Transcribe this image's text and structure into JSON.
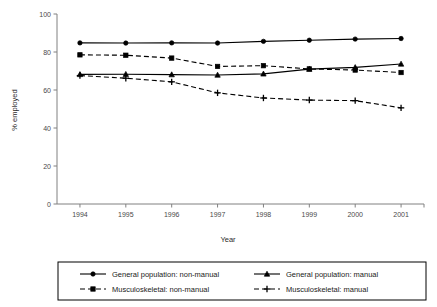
{
  "chart_data": {
    "type": "line",
    "title": "",
    "xlabel": "Year",
    "ylabel": "% employed",
    "categories": [
      "1994",
      "1995",
      "1996",
      "1997",
      "1998",
      "1999",
      "2000",
      "2001"
    ],
    "x": [
      1994,
      1995,
      1996,
      1997,
      1998,
      1999,
      2000,
      2001
    ],
    "ylim": [
      0,
      100
    ],
    "yticks": [
      0,
      20,
      40,
      60,
      80,
      100
    ],
    "ytick_labels": [
      "0",
      "20",
      "40",
      "60",
      "80",
      "100"
    ],
    "grid": false,
    "legend_position": "bottom",
    "series": [
      {
        "name": "General population: non-manual",
        "style": "solid",
        "marker": "circle",
        "values": [
          84.8,
          84.7,
          84.8,
          84.7,
          85.6,
          86.2,
          86.8,
          87.1
        ]
      },
      {
        "name": "General population: manual",
        "style": "solid",
        "marker": "triangle",
        "values": [
          68.2,
          68.3,
          68.1,
          67.9,
          68.5,
          71.0,
          71.9,
          73.7
        ]
      },
      {
        "name": "Musculoskeletal: non-manual",
        "style": "dashed",
        "marker": "square",
        "values": [
          78.5,
          78.3,
          76.8,
          72.4,
          72.8,
          71.1,
          70.5,
          69.2
        ]
      },
      {
        "name": "Musculoskeletal: manual",
        "style": "dashed",
        "marker": "plus",
        "values": [
          67.6,
          66.2,
          64.3,
          58.5,
          55.8,
          54.7,
          54.4,
          50.6
        ]
      }
    ]
  },
  "legend": {
    "entries": [
      {
        "label": "General population: non-manual",
        "style": "solid",
        "marker": "circle"
      },
      {
        "label": "General population: manual",
        "style": "solid",
        "marker": "triangle"
      },
      {
        "label": "Musculoskeletal: non-manual",
        "style": "dashed",
        "marker": "square"
      },
      {
        "label": "Musculoskeletal: manual",
        "style": "dashed",
        "marker": "plus"
      }
    ]
  },
  "colors": {
    "line": "#000000",
    "axis": "#808080",
    "tick_text": "#4a4a4a",
    "background": "#ffffff"
  }
}
